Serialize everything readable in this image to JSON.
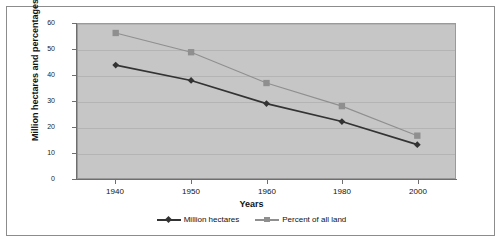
{
  "chart_data": {
    "type": "line",
    "title": "",
    "xlabel": "Years",
    "ylabel": "Million hectares and percentages",
    "categories": [
      "1940",
      "1950",
      "1960",
      "1980",
      "2000"
    ],
    "x_tick_labels": [
      "1940",
      "1950",
      "1960",
      "1980",
      "2000"
    ],
    "y_tick_labels": [
      "0",
      "10",
      "20",
      "30",
      "40",
      "50",
      "60"
    ],
    "y_ticks": [
      0,
      10,
      20,
      30,
      40,
      50,
      60
    ],
    "ylim": [
      0,
      60
    ],
    "grid": true,
    "legend_position": "bottom",
    "plot_background": "#c6c6c6",
    "series": [
      {
        "name": "Million hectares",
        "values": [
          44,
          38,
          29,
          22,
          13
        ],
        "color": "#333333",
        "marker": "diamond"
      },
      {
        "name": "Percent of all land",
        "values": [
          56.5,
          49,
          37,
          28,
          16.5
        ],
        "color": "#8f8f8f",
        "marker": "square"
      }
    ]
  },
  "legend": {
    "entries": [
      {
        "label": "Million hectares",
        "marker_icon": "diamond-marker-icon"
      },
      {
        "label": "Percent of all land",
        "marker_icon": "square-marker-icon"
      }
    ]
  }
}
